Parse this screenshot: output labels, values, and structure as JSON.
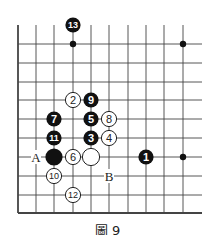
{
  "figure": {
    "caption": "圖 9",
    "grid": {
      "cols_x": [
        18,
        36,
        54,
        73,
        91,
        109,
        128,
        146,
        164,
        183
      ],
      "rows_y": [
        44,
        63,
        82,
        100,
        119,
        138,
        157,
        176,
        195,
        213
      ],
      "top_extend_y": 25,
      "right_extend_x": 202,
      "line_color": "#444444"
    },
    "star_points": [
      {
        "col": 3,
        "row": 0
      },
      {
        "col": 9,
        "row": 0
      },
      {
        "col": 9,
        "row": 6
      }
    ],
    "stones": [
      {
        "color": "black",
        "label": "13",
        "col": 3,
        "row": -1
      },
      {
        "color": "white",
        "label": "2",
        "col": 3,
        "row": 3
      },
      {
        "color": "black",
        "label": "9",
        "col": 4,
        "row": 3
      },
      {
        "color": "black",
        "label": "7",
        "col": 2,
        "row": 4
      },
      {
        "color": "black",
        "label": "5",
        "col": 4,
        "row": 4
      },
      {
        "color": "white",
        "label": "8",
        "col": 5,
        "row": 4
      },
      {
        "color": "black",
        "label": "11",
        "col": 2,
        "row": 5
      },
      {
        "color": "black",
        "label": "3",
        "col": 4,
        "row": 5
      },
      {
        "color": "white",
        "label": "4",
        "col": 5,
        "row": 5
      },
      {
        "color": "black",
        "label": "",
        "col": 2,
        "row": 6,
        "size": "large"
      },
      {
        "color": "white",
        "label": "6",
        "col": 3,
        "row": 6
      },
      {
        "color": "white",
        "label": "",
        "col": 4,
        "row": 6,
        "size": "large"
      },
      {
        "color": "black",
        "label": "1",
        "col": 7,
        "row": 6
      },
      {
        "color": "white",
        "label": "10",
        "col": 2,
        "row": 7
      },
      {
        "color": "white",
        "label": "12",
        "col": 3,
        "row": 8
      }
    ],
    "markers": [
      {
        "label": "A",
        "col": 1,
        "row": 6
      },
      {
        "label": "B",
        "col": 5,
        "row": 7
      }
    ]
  }
}
